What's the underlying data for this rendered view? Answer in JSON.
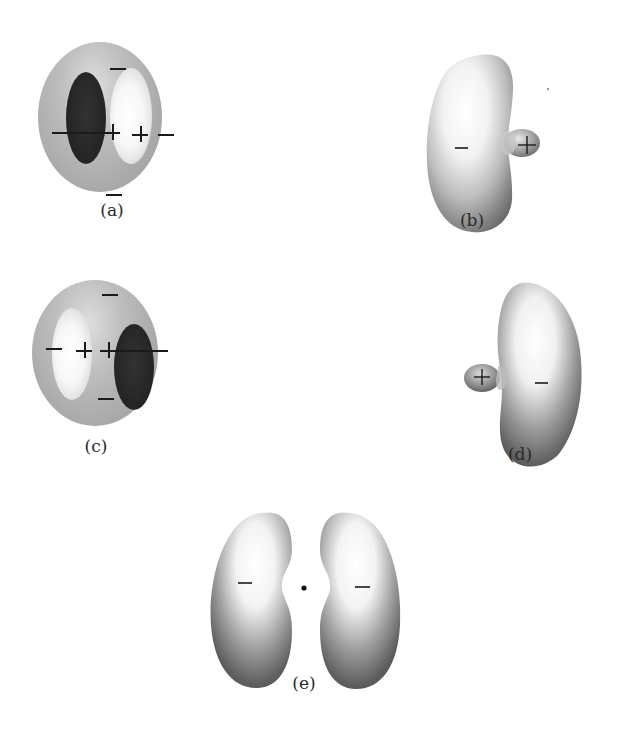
{
  "figure": {
    "panels": [
      {
        "id": "a",
        "label": "(a)",
        "shape": "sphere-with-two-ellipses",
        "signs": [
          "−",
          "+",
          "+",
          "−",
          "−",
          "−"
        ]
      },
      {
        "id": "b",
        "label": "(b)",
        "shape": "kidney-lobe-with-small-lobe-right",
        "signs": [
          "−",
          "+"
        ]
      },
      {
        "id": "c",
        "label": "(c)",
        "shape": "sphere-with-two-ellipses-mirrored",
        "signs": [
          "−",
          "+",
          "+",
          "−",
          "−",
          "−"
        ]
      },
      {
        "id": "d",
        "label": "(d)",
        "shape": "kidney-lobe-with-small-lobe-left",
        "signs": [
          "+",
          "−"
        ]
      },
      {
        "id": "e",
        "label": "(e)",
        "shape": "two-kidney-lobes-with-central-nucleus",
        "signs": [
          "−",
          "−"
        ]
      }
    ]
  },
  "colors": {
    "background": "#ffffff",
    "sphere_gray": "#a9a9a9",
    "dark_region": "#262626",
    "light_region": "#f7f7f7",
    "ink": "#1a1a1a"
  }
}
